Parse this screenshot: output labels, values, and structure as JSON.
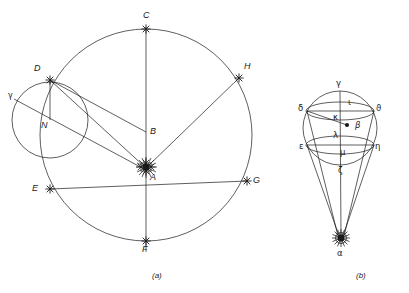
{
  "figure": {
    "captions": [
      {
        "key": "a",
        "text": "(a)",
        "x": 152,
        "y": 273
      },
      {
        "key": "b",
        "text": "(b)",
        "x": 356,
        "y": 273
      }
    ]
  },
  "panel_a": {
    "name": "Eccentric circle with Sun at A",
    "big_circle": {
      "cx": 146,
      "cy": 135,
      "r": 106
    },
    "small_circle": {
      "cx": 50,
      "cy": 120,
      "r": 38
    },
    "sun": {
      "label": "A",
      "x": 146,
      "y": 168,
      "symbol": "sun-starburst"
    },
    "points": [
      {
        "label": "C",
        "x": 146,
        "y": 29,
        "lx": 143,
        "ly": 11,
        "marker": "star"
      },
      {
        "label": "H",
        "x": 239,
        "y": 78,
        "lx": 244,
        "ly": 64,
        "marker": "star"
      },
      {
        "label": "G",
        "x": 247,
        "y": 181,
        "lx": 252,
        "ly": 176,
        "marker": "star"
      },
      {
        "label": "F",
        "x": 146,
        "y": 241,
        "lx": 142,
        "ly": 247,
        "marker": "star"
      },
      {
        "label": "E",
        "x": 50,
        "y": 189,
        "lx": 36,
        "ly": 184,
        "marker": "star"
      },
      {
        "label": "D",
        "x": 50,
        "y": 80,
        "lx": 36,
        "ly": 66,
        "marker": "star"
      },
      {
        "label": "B",
        "x": 146,
        "y": 132,
        "lx": 151,
        "ly": 128,
        "marker": "tick"
      },
      {
        "label": "N",
        "x": 50,
        "y": 120,
        "lx": 42,
        "ly": 122,
        "marker": "none"
      }
    ],
    "greek_label": {
      "text": "γ",
      "x": 10,
      "y": 94
    }
  },
  "panel_b": {
    "name": "Celestial sphere cone converging on Sun at alpha",
    "sphere": {
      "cx": 340,
      "cy": 128,
      "r": 37
    },
    "sun": {
      "label": "α",
      "x": 341,
      "y": 239,
      "symbol": "sun-starburst"
    },
    "center_dot": {
      "x": 347,
      "y": 125
    },
    "labels": [
      {
        "text": "γ",
        "x": 337,
        "y": 84
      },
      {
        "text": "ι",
        "x": 348,
        "y": 103
      },
      {
        "text": "δ",
        "x": 300,
        "y": 109
      },
      {
        "text": "ϑ",
        "x": 374,
        "y": 108
      },
      {
        "text": "κ",
        "x": 334,
        "y": 118
      },
      {
        "text": "β",
        "x": 355,
        "y": 127
      },
      {
        "text": "λ",
        "x": 334,
        "y": 137
      },
      {
        "text": "ε",
        "x": 302,
        "y": 148
      },
      {
        "text": "μ",
        "x": 341,
        "y": 153
      },
      {
        "text": "η",
        "x": 373,
        "y": 148
      },
      {
        "text": "ζ",
        "x": 339,
        "y": 172
      }
    ]
  },
  "style": {
    "stroke": "#1a1a1a",
    "background": "#ffffff",
    "line_width": 0.7
  }
}
